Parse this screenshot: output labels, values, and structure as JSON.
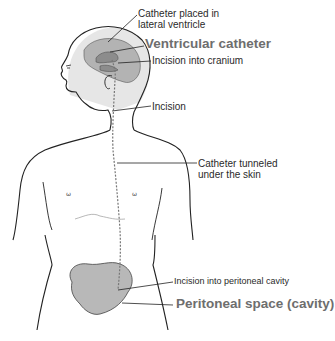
{
  "diagram": {
    "colors": {
      "brain": "#b5b5b5",
      "ventricle": "#8e8e8e",
      "head_shade": "#e4e4e4",
      "peritoneal": "#b8b8b8",
      "outline": "#222222",
      "callout_big": "#6e6e6e"
    },
    "labels": {
      "catheter_placed_line1": "Catheter placed in",
      "catheter_placed_line2": "lateral ventricle",
      "ventricular_catheter": "Ventricular catheter",
      "incision_cranium": "Incision into cranium",
      "incision": "Incision",
      "tunneled_line1": "Catheter tunneled",
      "tunneled_line2": "under the skin",
      "incision_peritoneal": "Incision into peritoneal cavity",
      "peritoneal_space": "Peritoneal space (cavity)"
    }
  }
}
